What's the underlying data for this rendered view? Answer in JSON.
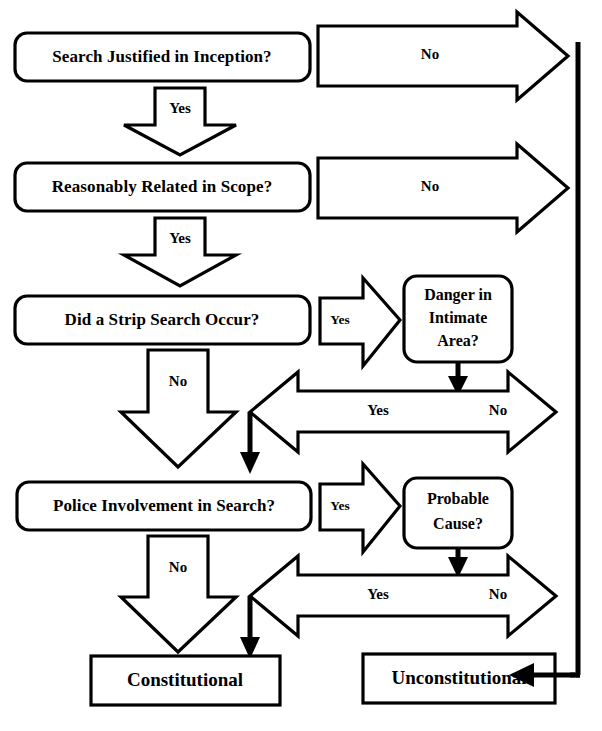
{
  "diagram": {
    "type": "flowchart",
    "background_color": "#ffffff",
    "line_color": "#000000",
    "nodes": [
      {
        "id": "q1",
        "label": "Search Justified in Inception?",
        "shape": "rounded-rect"
      },
      {
        "id": "q2",
        "label": "Reasonably Related in Scope?",
        "shape": "rounded-rect"
      },
      {
        "id": "q3",
        "label": "Did a Strip Search Occur?",
        "shape": "rounded-rect"
      },
      {
        "id": "q4",
        "label_line1": "Danger in",
        "label_line2": "Intimate",
        "label_line3": "Area?",
        "shape": "rounded-rect"
      },
      {
        "id": "q5",
        "label": "Police Involvement in Search?",
        "shape": "rounded-rect"
      },
      {
        "id": "q6",
        "label_line1": "Probable",
        "label_line2": "Cause?",
        "shape": "rounded-rect"
      },
      {
        "id": "r1",
        "label": "Constitutional",
        "shape": "rect"
      },
      {
        "id": "r2",
        "label": "Unconstitutional",
        "shape": "rect"
      }
    ],
    "edges": [
      {
        "id": "e1",
        "label": "No",
        "direction": "right",
        "from": "q1"
      },
      {
        "id": "e2",
        "label": "Yes",
        "direction": "down",
        "from": "q1",
        "to": "q2"
      },
      {
        "id": "e3",
        "label": "No",
        "direction": "right",
        "from": "q2"
      },
      {
        "id": "e4",
        "label": "Yes",
        "direction": "down",
        "from": "q2",
        "to": "q3"
      },
      {
        "id": "e5",
        "label": "Yes",
        "direction": "right",
        "from": "q3",
        "to": "q4"
      },
      {
        "id": "e6",
        "label": "No",
        "direction": "down",
        "from": "q3",
        "to": "q5"
      },
      {
        "id": "e7",
        "label": "Yes",
        "direction": "left",
        "from": "q4"
      },
      {
        "id": "e8",
        "label": "No",
        "direction": "right",
        "from": "q4"
      },
      {
        "id": "e9",
        "label": "Yes",
        "direction": "right",
        "from": "q5",
        "to": "q6"
      },
      {
        "id": "e10",
        "label": "No",
        "direction": "down",
        "from": "q5",
        "to": "r1"
      },
      {
        "id": "e11",
        "label": "Yes",
        "direction": "left",
        "from": "q6",
        "to": "r1"
      },
      {
        "id": "e12",
        "label": "No",
        "direction": "right",
        "from": "q6",
        "to": "r2"
      }
    ]
  }
}
